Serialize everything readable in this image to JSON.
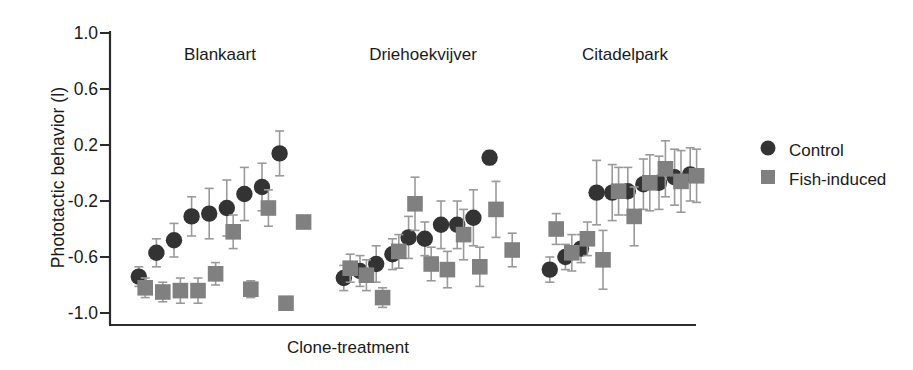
{
  "figure": {
    "ylabel": "Phototactic behavior (l)",
    "xlabel": "Clone-treatment",
    "yticks": [
      "1.0",
      "0.6",
      "0.2",
      "-0.2",
      "-0.6",
      "-1.0"
    ],
    "group_labels": [
      "Blankaart",
      "Driehoekvijver",
      "Citadelpark"
    ],
    "legend": [
      {
        "label": "Control",
        "marker": "circle",
        "color": "#333333"
      },
      {
        "label": "Fish-induced",
        "marker": "square",
        "color": "#808080"
      }
    ]
  },
  "chart_data": {
    "type": "scatter",
    "title": "",
    "xlabel": "Clone-treatment",
    "ylabel": "Phototactic behavior (l)",
    "ylim": [
      -1.0,
      1.0
    ],
    "yticks": [
      1.0,
      0.6,
      0.2,
      -0.2,
      -0.6,
      -1.0
    ],
    "grid": false,
    "legend_position": "right",
    "error_bars": "standard error",
    "groups": [
      {
        "name": "Blankaart",
        "series": [
          {
            "name": "Control",
            "marker": "circle",
            "color": "#333333",
            "points": [
              {
                "x": 1,
                "y": -0.74,
                "err": 0.07
              },
              {
                "x": 2,
                "y": -0.57,
                "err": 0.1
              },
              {
                "x": 3,
                "y": -0.48,
                "err": 0.12
              },
              {
                "x": 4,
                "y": -0.31,
                "err": 0.14
              },
              {
                "x": 5,
                "y": -0.29,
                "err": 0.18
              },
              {
                "x": 6,
                "y": -0.25,
                "err": 0.2
              },
              {
                "x": 7,
                "y": -0.15,
                "err": 0.19
              },
              {
                "x": 8,
                "y": -0.1,
                "err": 0.17
              },
              {
                "x": 9,
                "y": 0.14,
                "err": 0.16
              }
            ]
          },
          {
            "name": "Fish-induced",
            "marker": "square",
            "color": "#808080",
            "points": [
              {
                "x": 1,
                "y": -0.82,
                "err": 0.07
              },
              {
                "x": 2,
                "y": -0.85,
                "err": 0.07
              },
              {
                "x": 3,
                "y": -0.84,
                "err": 0.09
              },
              {
                "x": 4,
                "y": -0.84,
                "err": 0.09
              },
              {
                "x": 5,
                "y": -0.72,
                "err": 0.08
              },
              {
                "x": 6,
                "y": -0.42,
                "err": 0.12
              },
              {
                "x": 7,
                "y": -0.83,
                "err": 0.06
              },
              {
                "x": 8,
                "y": -0.25,
                "err": 0.13
              },
              {
                "x": 9,
                "y": -0.93,
                "err": 0.03
              },
              {
                "x": 10,
                "y": -0.35,
                "err": 0.04
              }
            ]
          }
        ]
      },
      {
        "name": "Driehoekvijver",
        "series": [
          {
            "name": "Control",
            "marker": "circle",
            "color": "#333333",
            "points": [
              {
                "x": 1,
                "y": -0.75,
                "err": 0.09
              },
              {
                "x": 2,
                "y": -0.7,
                "err": 0.11
              },
              {
                "x": 3,
                "y": -0.65,
                "err": 0.13
              },
              {
                "x": 4,
                "y": -0.58,
                "err": 0.11
              },
              {
                "x": 5,
                "y": -0.46,
                "err": 0.15
              },
              {
                "x": 6,
                "y": -0.47,
                "err": 0.12
              },
              {
                "x": 7,
                "y": -0.37,
                "err": 0.17
              },
              {
                "x": 8,
                "y": -0.37,
                "err": 0.17
              },
              {
                "x": 9,
                "y": -0.32,
                "err": 0.2
              },
              {
                "x": 10,
                "y": 0.11,
                "err": 0.05
              }
            ]
          },
          {
            "name": "Fish-induced",
            "marker": "square",
            "color": "#808080",
            "points": [
              {
                "x": 1,
                "y": -0.68,
                "err": 0.1
              },
              {
                "x": 2,
                "y": -0.73,
                "err": 0.11
              },
              {
                "x": 3,
                "y": -0.89,
                "err": 0.07
              },
              {
                "x": 4,
                "y": -0.56,
                "err": 0.12
              },
              {
                "x": 5,
                "y": -0.22,
                "err": 0.19
              },
              {
                "x": 6,
                "y": -0.65,
                "err": 0.12
              },
              {
                "x": 7,
                "y": -0.69,
                "err": 0.13
              },
              {
                "x": 8,
                "y": -0.44,
                "err": 0.18
              },
              {
                "x": 9,
                "y": -0.67,
                "err": 0.14
              },
              {
                "x": 10,
                "y": -0.26,
                "err": 0.2
              },
              {
                "x": 11,
                "y": -0.55,
                "err": 0.12
              }
            ]
          }
        ]
      },
      {
        "name": "Citadelpark",
        "series": [
          {
            "name": "Control",
            "marker": "circle",
            "color": "#333333",
            "points": [
              {
                "x": 1,
                "y": -0.69,
                "err": 0.09
              },
              {
                "x": 2,
                "y": -0.6,
                "err": 0.09
              },
              {
                "x": 3,
                "y": -0.54,
                "err": 0.1
              },
              {
                "x": 4,
                "y": -0.14,
                "err": 0.23
              },
              {
                "x": 5,
                "y": -0.14,
                "err": 0.2
              },
              {
                "x": 6,
                "y": -0.13,
                "err": 0.17
              },
              {
                "x": 7,
                "y": -0.08,
                "err": 0.18
              },
              {
                "x": 8,
                "y": -0.07,
                "err": 0.19
              },
              {
                "x": 9,
                "y": -0.03,
                "err": 0.2
              },
              {
                "x": 10,
                "y": -0.01,
                "err": 0.19
              }
            ]
          },
          {
            "name": "Fish-induced",
            "marker": "square",
            "color": "#808080",
            "points": [
              {
                "x": 1,
                "y": -0.4,
                "err": 0.11
              },
              {
                "x": 2,
                "y": -0.57,
                "err": 0.13
              },
              {
                "x": 3,
                "y": -0.47,
                "err": 0.12
              },
              {
                "x": 4,
                "y": -0.62,
                "err": 0.21
              },
              {
                "x": 5,
                "y": -0.13,
                "err": 0.17
              },
              {
                "x": 6,
                "y": -0.31,
                "err": 0.21
              },
              {
                "x": 7,
                "y": -0.07,
                "err": 0.2
              },
              {
                "x": 8,
                "y": 0.03,
                "err": 0.2
              },
              {
                "x": 9,
                "y": -0.06,
                "err": 0.22
              },
              {
                "x": 10,
                "y": -0.02,
                "err": 0.19
              }
            ]
          }
        ]
      }
    ]
  }
}
